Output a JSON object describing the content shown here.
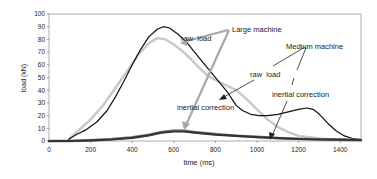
{
  "chart_data": {
    "type": "line",
    "title": "",
    "xlabel": "time (ms)",
    "ylabel": "load (kN)",
    "xlim": [
      0,
      1500
    ],
    "ylim": [
      0,
      100
    ],
    "xticks": [
      0,
      200,
      400,
      600,
      800,
      1000,
      1200,
      1400
    ],
    "yticks": [
      0,
      10,
      20,
      30,
      40,
      50,
      60,
      70,
      80,
      90,
      100
    ],
    "grid": false,
    "legend": "none (inline annotations)",
    "series": [
      {
        "name": "Large machine raw load",
        "color": "#111111",
        "width": 1.2,
        "points": [
          [
            0,
            0
          ],
          [
            90,
            0
          ],
          [
            100,
            2
          ],
          [
            130,
            5
          ],
          [
            180,
            9
          ],
          [
            230,
            15
          ],
          [
            280,
            24
          ],
          [
            320,
            35
          ],
          [
            360,
            47
          ],
          [
            400,
            60
          ],
          [
            440,
            72
          ],
          [
            480,
            82
          ],
          [
            520,
            88
          ],
          [
            550,
            90
          ],
          [
            580,
            89
          ],
          [
            620,
            84
          ],
          [
            660,
            78
          ],
          [
            700,
            70
          ],
          [
            740,
            62
          ],
          [
            780,
            54
          ],
          [
            820,
            46
          ],
          [
            860,
            38
          ],
          [
            880,
            33
          ],
          [
            900,
            28
          ],
          [
            930,
            24
          ],
          [
            970,
            21
          ],
          [
            1010,
            20
          ],
          [
            1050,
            20
          ],
          [
            1100,
            21
          ],
          [
            1150,
            23
          ],
          [
            1200,
            25
          ],
          [
            1240,
            26
          ],
          [
            1270,
            25
          ],
          [
            1300,
            21
          ],
          [
            1340,
            14
          ],
          [
            1380,
            8
          ],
          [
            1420,
            4
          ],
          [
            1460,
            2
          ],
          [
            1500,
            1
          ]
        ]
      },
      {
        "name": "Medium machine raw load",
        "color": "#c8c8c8",
        "width": 2.4,
        "points": [
          [
            0,
            0
          ],
          [
            90,
            0
          ],
          [
            100,
            2
          ],
          [
            140,
            8
          ],
          [
            200,
            17
          ],
          [
            260,
            28
          ],
          [
            320,
            42
          ],
          [
            380,
            56
          ],
          [
            430,
            68
          ],
          [
            480,
            77
          ],
          [
            520,
            81
          ],
          [
            560,
            80
          ],
          [
            600,
            76
          ],
          [
            640,
            71
          ],
          [
            680,
            65
          ],
          [
            720,
            58
          ],
          [
            760,
            52
          ],
          [
            800,
            48
          ],
          [
            850,
            44
          ],
          [
            900,
            40
          ],
          [
            950,
            33
          ],
          [
            1000,
            25
          ],
          [
            1050,
            17
          ],
          [
            1100,
            11
          ],
          [
            1150,
            7
          ],
          [
            1200,
            4
          ],
          [
            1300,
            2
          ],
          [
            1400,
            1
          ],
          [
            1500,
            0
          ]
        ]
      },
      {
        "name": "Large machine inertial correction",
        "color": "#333333",
        "width": 2.2,
        "points": [
          [
            0,
            0
          ],
          [
            100,
            0
          ],
          [
            200,
            0.5
          ],
          [
            300,
            1.2
          ],
          [
            400,
            2.5
          ],
          [
            480,
            4.5
          ],
          [
            540,
            6.5
          ],
          [
            600,
            7.5
          ],
          [
            650,
            7.5
          ],
          [
            700,
            6.5
          ],
          [
            800,
            5
          ],
          [
            900,
            4
          ],
          [
            1000,
            3
          ],
          [
            1100,
            2.2
          ],
          [
            1200,
            1.6
          ],
          [
            1300,
            1.2
          ],
          [
            1400,
            1
          ],
          [
            1500,
            0.8
          ]
        ]
      },
      {
        "name": "Medium machine inertial correction",
        "color": "#888888",
        "width": 2.6,
        "points": [
          [
            0,
            0
          ],
          [
            100,
            0
          ],
          [
            200,
            0.5
          ],
          [
            300,
            1.5
          ],
          [
            400,
            3
          ],
          [
            480,
            5
          ],
          [
            540,
            7
          ],
          [
            600,
            8.3
          ],
          [
            650,
            8.2
          ],
          [
            700,
            7
          ],
          [
            800,
            5.5
          ],
          [
            900,
            4.2
          ],
          [
            1000,
            3.2
          ],
          [
            1100,
            2.4
          ],
          [
            1200,
            1.8
          ],
          [
            1300,
            1.3
          ],
          [
            1400,
            1
          ],
          [
            1500,
            0.8
          ]
        ]
      }
    ],
    "annotations": [
      {
        "text": "raw  load",
        "group": "Large machine"
      },
      {
        "text": "Large machine"
      },
      {
        "text": "inertial correction",
        "group": "Large machine"
      },
      {
        "text": "Medium machine"
      },
      {
        "text": "raw  load",
        "group": "Medium machine"
      },
      {
        "text": "inertial correction",
        "group": "Medium machine"
      }
    ]
  },
  "labels": {
    "xlabel": "time (ms)",
    "ylabel": "load (kN)",
    "ann_raw_load_large": "raw  load",
    "ann_large_machine": "Large machine",
    "ann_inertial_large": "inertial correction",
    "ann_medium_machine": "Medium machine",
    "ann_raw_load_medium": "raw  load",
    "ann_inertial_medium": "inertial correction"
  }
}
